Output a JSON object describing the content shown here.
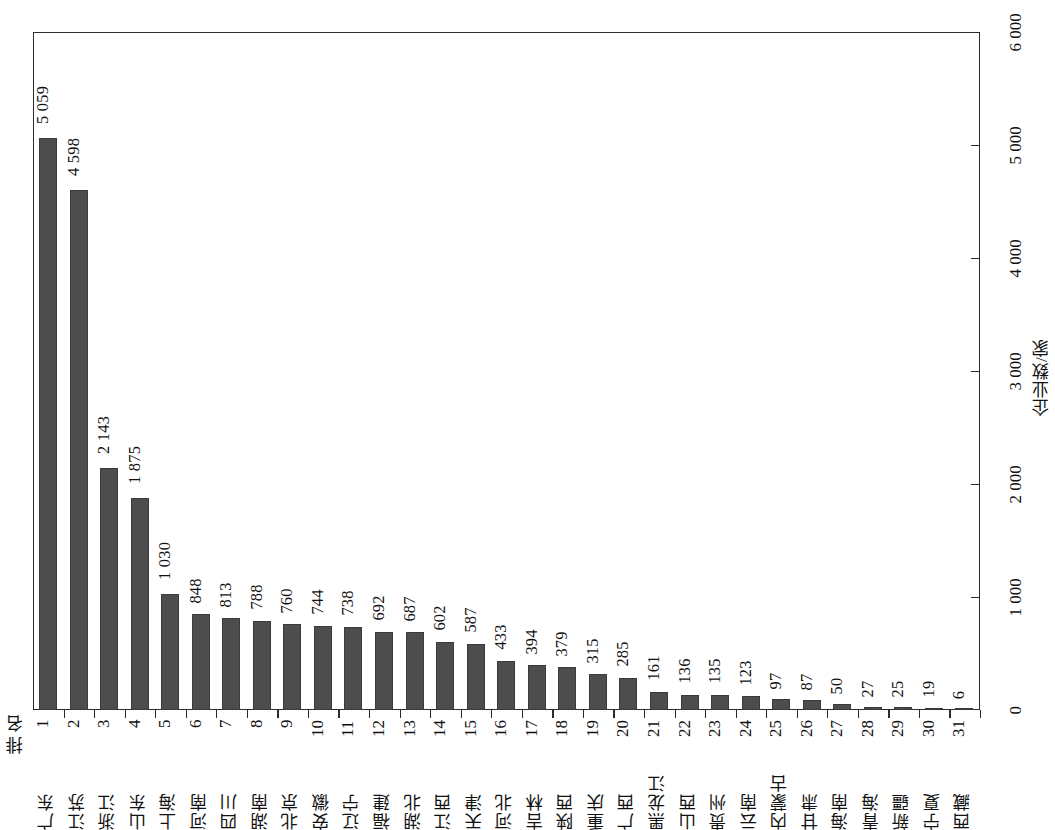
{
  "chart_data": {
    "type": "bar",
    "title": "",
    "xlabel": "",
    "ylabel": "企业数/家",
    "ylim": [
      0,
      6000
    ],
    "ytick_values": [
      0,
      1000,
      2000,
      3000,
      4000,
      5000,
      6000
    ],
    "ytick_labels": [
      "0",
      "1 000",
      "2 000",
      "3 000",
      "4 000",
      "5 000",
      "6 000"
    ],
    "grid": false,
    "legend": "none",
    "orientation": "vertical",
    "bar_color": "#4d4d4d",
    "rank_header": "排 名",
    "categories": [
      "广东",
      "江苏",
      "浙江",
      "山东",
      "上海",
      "河南",
      "四川",
      "湖南",
      "北京",
      "安徽",
      "辽宁",
      "福建",
      "湖北",
      "江西",
      "天津",
      "河北",
      "吉林",
      "陕西",
      "重庆",
      "广西",
      "黑龙江",
      "山西",
      "贵州",
      "云南",
      "内蒙古",
      "甘肃",
      "海南",
      "青海",
      "新疆",
      "宁夏",
      "西藏"
    ],
    "ranks": [
      "1",
      "2",
      "3",
      "4",
      "5",
      "6",
      "7",
      "8",
      "9",
      "10",
      "11",
      "12",
      "13",
      "14",
      "15",
      "16",
      "17",
      "18",
      "19",
      "20",
      "21",
      "22",
      "23",
      "24",
      "25",
      "26",
      "27",
      "28",
      "29",
      "30",
      "31"
    ],
    "values": [
      5059,
      4598,
      2143,
      1875,
      1030,
      848,
      813,
      788,
      760,
      744,
      738,
      692,
      687,
      602,
      587,
      433,
      394,
      379,
      315,
      285,
      161,
      136,
      135,
      123,
      97,
      87,
      50,
      27,
      25,
      19,
      6
    ],
    "value_labels": [
      "5 059",
      "4 598",
      "2 143",
      "1 875",
      "1 030",
      "848",
      "813",
      "788",
      "760",
      "744",
      "738",
      "692",
      "687",
      "602",
      "587",
      "433",
      "394",
      "379",
      "315",
      "285",
      "161",
      "136",
      "135",
      "123",
      "97",
      "87",
      "50",
      "27",
      "25",
      "19",
      "6"
    ]
  }
}
